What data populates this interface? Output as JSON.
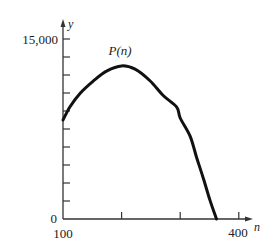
{
  "chart_data": {
    "type": "line",
    "title": "",
    "xlabel": "n",
    "ylabel": "y",
    "xlim": [
      100,
      400
    ],
    "ylim": [
      0,
      15000
    ],
    "x_ticks": [
      100,
      200,
      300,
      400
    ],
    "x_tick_labels": [
      "100",
      "",
      "",
      "400"
    ],
    "y_ticks": [
      0,
      1500,
      3000,
      4500,
      6000,
      7500,
      9000,
      10500,
      12000,
      13500,
      15000
    ],
    "y_tick_labels": [
      "0",
      "",
      "",
      "",
      "",
      "",
      "",
      "",
      "",
      "",
      "15,000"
    ],
    "grid": false,
    "legend": null,
    "series": [
      {
        "name": "P(n)",
        "label": "P(n)",
        "x": [
          100,
          112,
          129,
          152,
          175,
          200,
          223,
          248,
          271,
          294,
          300,
          317,
          328,
          340,
          351,
          362
        ],
        "values": [
          8250,
          9360,
          10470,
          11580,
          12420,
          12960,
          12690,
          11580,
          10330,
          8940,
          9080,
          6580,
          5330,
          3250,
          1440,
          0
        ]
      }
    ],
    "annotations": [
      {
        "text": "P(n)",
        "near_x": 200,
        "near_y": 13500
      }
    ]
  },
  "labels": {
    "y_axis_name": "y",
    "x_axis_name": "n",
    "y_max_label": "15,000",
    "y_zero_label": "0",
    "x_min_label": "100",
    "x_max_label": "400",
    "curve_label": "P(n)"
  },
  "colors": {
    "axis": "#333333",
    "curve": "#111111",
    "text": "#222222",
    "background": "#ffffff"
  }
}
